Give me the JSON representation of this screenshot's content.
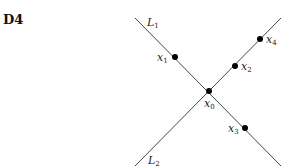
{
  "figure": {
    "label": "D4",
    "lines": [
      {
        "name": "L",
        "sub": "1",
        "x1": 135,
        "y1": 18,
        "x2": 281,
        "y2": 166,
        "label_x": 147,
        "label_y": 26
      },
      {
        "name": "L",
        "sub": "2",
        "x1": 135,
        "y1": 166,
        "x2": 281,
        "y2": 18,
        "label_x": 148,
        "label_y": 164
      }
    ],
    "points": [
      {
        "name": "x",
        "sub": "0",
        "cx": 209,
        "cy": 91,
        "label_x": 204,
        "label_y": 107
      },
      {
        "name": "x",
        "sub": "1",
        "cx": 175,
        "cy": 57,
        "label_x": 157,
        "label_y": 61
      },
      {
        "name": "x",
        "sub": "2",
        "cx": 235,
        "cy": 66,
        "label_x": 241,
        "label_y": 70
      },
      {
        "name": "x",
        "sub": "3",
        "cx": 245,
        "cy": 128,
        "label_x": 228,
        "label_y": 132
      },
      {
        "name": "x",
        "sub": "4",
        "cx": 260,
        "cy": 39,
        "label_x": 266,
        "label_y": 43
      }
    ]
  }
}
